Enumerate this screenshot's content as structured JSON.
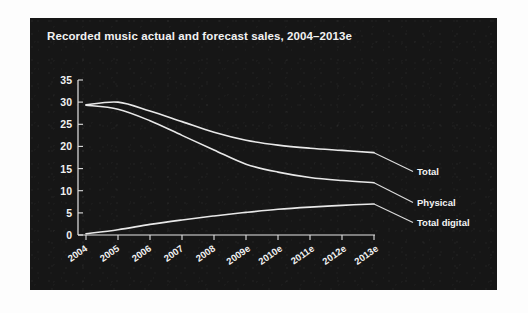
{
  "figure": {
    "background_color": "#fdfdfd",
    "panel_color": "#161616"
  },
  "chart_data": {
    "type": "line",
    "title": "Recorded music actual and forecast sales, 2004–2013e",
    "xlabel": "",
    "ylabel": "",
    "categories": [
      "2004",
      "2005",
      "2006",
      "2007",
      "2008",
      "2009e",
      "2010e",
      "2011e",
      "2012e",
      "2013e"
    ],
    "ylim": [
      0,
      35
    ],
    "yticks": [
      0,
      5,
      10,
      15,
      20,
      25,
      30,
      35
    ],
    "grid": false,
    "legend_position": "right-inline-labels",
    "line_color": "#e8e8e8",
    "series": [
      {
        "name": "Total",
        "label": "Total",
        "values": [
          29.4,
          30.0,
          28.0,
          25.6,
          23.2,
          21.4,
          20.3,
          19.6,
          19.1,
          18.6
        ]
      },
      {
        "name": "Physical",
        "label": "Physical",
        "values": [
          29.3,
          28.4,
          25.8,
          22.5,
          19.2,
          16.0,
          14.2,
          13.0,
          12.3,
          11.8
        ]
      },
      {
        "name": "Total digital",
        "label": "Total digital",
        "values": [
          0.3,
          1.2,
          2.4,
          3.4,
          4.3,
          5.1,
          5.8,
          6.3,
          6.7,
          7.0
        ]
      }
    ]
  }
}
